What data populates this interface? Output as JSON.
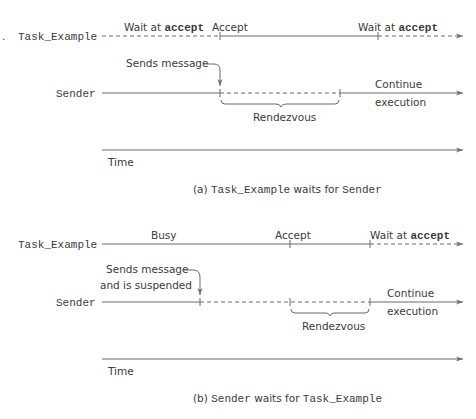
{
  "panel_a": {
    "task_label": "Task_Example",
    "sender_label": "Sender",
    "task_segments": [
      {
        "label_prefix": "Wait at ",
        "label_bold": "accept",
        "style": "dashed"
      },
      {
        "label": "Accept",
        "style": "solid"
      },
      {
        "label_prefix": "Wait at ",
        "label_bold": "accept",
        "style": "dashed"
      }
    ],
    "sends_message": "Sends message",
    "rendezvous": "Rendezvous",
    "continue_line1": "Continue",
    "continue_line2": "execution",
    "time_label": "Time",
    "caption_prefix": "(a) ",
    "caption_code1": "Task_Example",
    "caption_mid": " waits for ",
    "caption_code2": "Sender"
  },
  "panel_b": {
    "task_label": "Task_Example",
    "sender_label": "Sender",
    "busy": "Busy",
    "accept": "Accept",
    "wait_prefix": "Wait at ",
    "wait_bold": "accept",
    "sends_message_line1": "Sends message",
    "sends_message_line2": "and is suspended",
    "rendezvous": "Rendezvous",
    "continue_line1": "Continue",
    "continue_line2": "execution",
    "time_label": "Time",
    "caption_prefix": "(b) ",
    "caption_code1": "Sender",
    "caption_mid": " waits for ",
    "caption_code2": "Task_Example"
  },
  "colors": {
    "line": "#6a6a6a",
    "text": "#3a3a3a",
    "background": "#ffffff"
  }
}
